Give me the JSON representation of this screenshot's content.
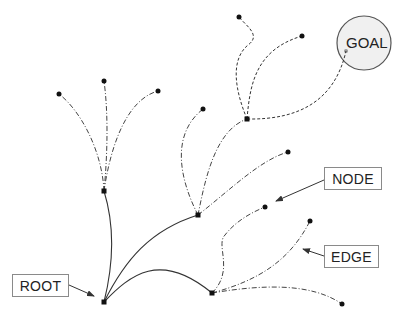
{
  "diagram": {
    "labels": {
      "root": "ROOT",
      "node": "NODE",
      "edge": "EDGE",
      "goal": "GOAL"
    },
    "colors": {
      "edge": "#333333",
      "node": "#111111",
      "goal_fill": "#f0f0f0",
      "goal_stroke": "#555555",
      "goal_marker": "#999999",
      "label_border": "#8a8a8a"
    },
    "nodes": [
      {
        "id": "root",
        "x": 104,
        "y": 302
      },
      {
        "id": "n1",
        "x": 104,
        "y": 191
      },
      {
        "id": "n2",
        "x": 198,
        "y": 215
      },
      {
        "id": "n3",
        "x": 212,
        "y": 293
      },
      {
        "id": "n4",
        "x": 247,
        "y": 119
      },
      {
        "id": "n5",
        "x": 59,
        "y": 94
      },
      {
        "id": "n6",
        "x": 104,
        "y": 81
      },
      {
        "id": "n7",
        "x": 158,
        "y": 91
      },
      {
        "id": "n8",
        "x": 203,
        "y": 109
      },
      {
        "id": "n9",
        "x": 288,
        "y": 152
      },
      {
        "id": "n10",
        "x": 239,
        "y": 17
      },
      {
        "id": "n11",
        "x": 302,
        "y": 36
      },
      {
        "id": "n12",
        "x": 265,
        "y": 207
      },
      {
        "id": "n13",
        "x": 310,
        "y": 221
      },
      {
        "id": "n14",
        "x": 342,
        "y": 304
      }
    ],
    "goal": {
      "cx": 364,
      "cy": 43,
      "r": 27
    }
  }
}
